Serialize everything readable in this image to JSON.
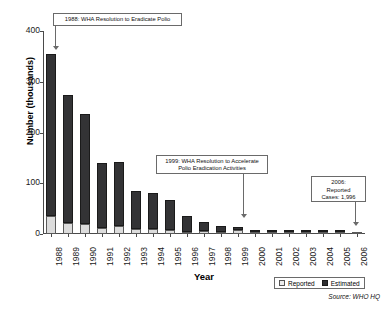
{
  "chart_data": {
    "type": "bar",
    "title": "",
    "subtitle": "",
    "xlabel": "Year",
    "ylabel": "Number (thousands)",
    "ylim": [
      0,
      400
    ],
    "yticks": [
      0,
      100,
      200,
      300,
      400
    ],
    "ytick_labels": [
      "0",
      "100",
      "200",
      "300",
      "400"
    ],
    "grid": false,
    "stacked": true,
    "legend_position": "bottom-right",
    "categories": [
      "1988",
      "1989",
      "1990",
      "1991",
      "1992",
      "1993",
      "1994",
      "1995",
      "1996",
      "1997",
      "1998",
      "1999",
      "2000",
      "2001",
      "2002",
      "2003",
      "2004",
      "2005",
      "2006"
    ],
    "series": [
      {
        "name": "Reported",
        "color": "#dcdcdc",
        "values": [
          35,
          21,
          20,
          11,
          16,
          10,
          9,
          7,
          4,
          6,
          2,
          7,
          3,
          1,
          1,
          1,
          1,
          1,
          2
        ]
      },
      {
        "name": "Estimated",
        "color": "#333335",
        "values": [
          320,
          253,
          217,
          128,
          126,
          75,
          71,
          61,
          32,
          18,
          11,
          6,
          4,
          2,
          2,
          2,
          2,
          2,
          0
        ]
      }
    ],
    "totals": [
      355,
      274,
      237,
      139,
      142,
      85,
      80,
      68,
      36,
      24,
      13,
      13,
      7,
      3,
      3,
      3,
      3,
      3,
      2
    ],
    "annotations": [
      {
        "id": "annot-1988",
        "lines": [
          "1988: WHA Resolution to Eradicate Polio"
        ],
        "target_category": "1988"
      },
      {
        "id": "annot-1999",
        "lines": [
          "1999: WHA Resolution to Accelerate",
          "Polio Eradication Activities"
        ],
        "target_category": "1999"
      },
      {
        "id": "annot-2006",
        "lines": [
          "2006:",
          "Reported",
          "Cases: 1,996"
        ],
        "target_category": "2006"
      }
    ],
    "source": "Source: WHO HQ"
  },
  "legend": {
    "items": [
      {
        "label": "Reported",
        "swatch": "reported"
      },
      {
        "label": "Estimated",
        "swatch": "estimated"
      }
    ]
  }
}
